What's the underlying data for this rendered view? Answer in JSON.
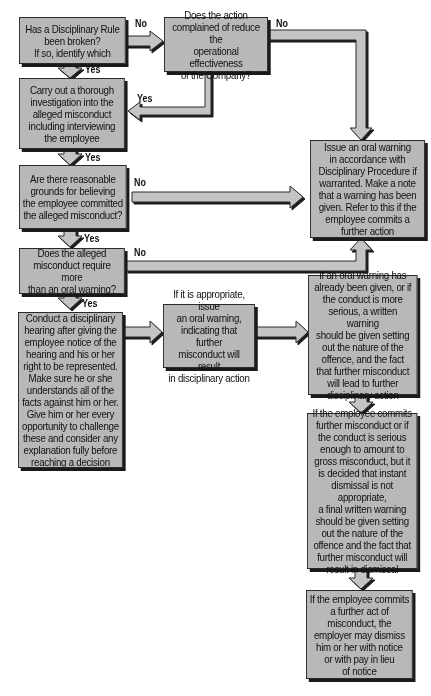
{
  "diagram": {
    "type": "flowchart",
    "colors": {
      "box_fill": "#b8b8b8",
      "box_border": "#2a2a2a",
      "shadow": "#1a1a1a",
      "arrow_fill": "#c4c4c4"
    },
    "nodes": {
      "q_rule_broken": {
        "text": "Has a Disciplinary Rule\nbeen broken?\nIf so, identify which"
      },
      "q_reduce_effectiveness": {
        "text": "Does the action\ncomplained of reduce the\noperational effectiveness\nof the Company?"
      },
      "investigate": {
        "text": "Carry out a thorough\ninvestigation into the\nalleged misconduct\nincluding interviewing\nthe employee"
      },
      "q_reasonable_grounds": {
        "text": "Are there reasonable\ngrounds for believing\nthe employee committed\nthe alleged misconduct?"
      },
      "q_more_than_oral": {
        "text": "Does the alleged\nmisconduct require more\nthan an oral warning?"
      },
      "oral_warning_procedure": {
        "text": "Issue an oral warning\nin accordance with\nDisciplinary Procedure if\nwarranted. Make a note\nthat a warning has been\ngiven. Refer to this if the\nemployee commits a\nfurther action"
      },
      "hearing": {
        "text": "Conduct a disciplinary\nhearing after giving the\nemployee notice of the\nhearing and his or her\nright to be represented.\nMake sure he or she\nunderstands all of the\nfacts against him or her.\nGive him or her every\nopportunity to challenge\nthese and consider any\nexplanation fully before\nreaching a decision"
      },
      "oral_warning_if_appropriate": {
        "text": "If it is appropriate, issue\nan oral warning,\nindicating that further\nmisconduct will result\nin disciplinary action"
      },
      "written_warning": {
        "text": "If an oral warning has\nalready been given, or if\nthe conduct is more\nserious, a written warning\nshould be given setting\nout the nature of the\noffence, and the fact\nthat further misconduct\nwill lead to further\ndisciplinary action"
      },
      "final_written_warning": {
        "text": "If the employee commits\nfurther misconduct or if\nthe conduct is serious\nenough to amount to\ngross misconduct, but it\nis decided that instant\ndismissal is not appropriate,\na final written warning\nshould be given setting\nout the nature of the\noffence and the fact that\nfurther misconduct will\nresult in dismissal"
      },
      "dismissal": {
        "text": "If the employee commits\na further act of\nmisconduct, the\nemployer may dismiss\nhim or her with notice\nor with pay in lieu\nof notice"
      }
    },
    "edge_labels": {
      "rule_no": "No",
      "rule_yes": "Yes",
      "reduce_no": "No",
      "reduce_yes": "Yes",
      "investigate_yes": "Yes",
      "grounds_no": "No",
      "grounds_yes": "Yes",
      "more_no": "No",
      "more_yes": "Yes"
    },
    "edges": [
      {
        "from": "q_rule_broken",
        "to": "q_reduce_effectiveness",
        "label": "No"
      },
      {
        "from": "q_rule_broken",
        "to": "investigate",
        "label": "Yes"
      },
      {
        "from": "q_reduce_effectiveness",
        "to": "investigate",
        "label": "Yes"
      },
      {
        "from": "q_reduce_effectiveness",
        "to": "oral_warning_procedure",
        "label": "No"
      },
      {
        "from": "investigate",
        "to": "q_reasonable_grounds",
        "label": "Yes"
      },
      {
        "from": "q_reasonable_grounds",
        "to": "oral_warning_procedure",
        "label": "No"
      },
      {
        "from": "q_reasonable_grounds",
        "to": "q_more_than_oral",
        "label": "Yes"
      },
      {
        "from": "q_more_than_oral",
        "to": "oral_warning_procedure",
        "label": "No"
      },
      {
        "from": "q_more_than_oral",
        "to": "hearing",
        "label": "Yes"
      },
      {
        "from": "hearing",
        "to": "oral_warning_if_appropriate",
        "label": ""
      },
      {
        "from": "oral_warning_if_appropriate",
        "to": "written_warning",
        "label": ""
      },
      {
        "from": "written_warning",
        "to": "final_written_warning",
        "label": ""
      },
      {
        "from": "final_written_warning",
        "to": "dismissal",
        "label": ""
      }
    ]
  }
}
